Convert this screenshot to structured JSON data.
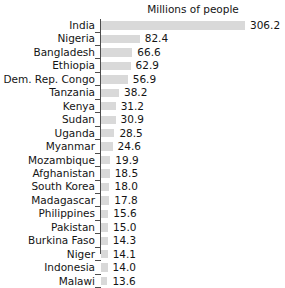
{
  "chart_data": {
    "type": "bar",
    "orientation": "horizontal",
    "title": "Millions of people",
    "xlabel": "",
    "ylabel": "",
    "xlim": [
      0,
      340
    ],
    "grid": false,
    "legend": null,
    "bar_color": "#d9d9d9",
    "axis_color": "#4d4d4d",
    "text_color": "#141414",
    "background": "#ffffff",
    "categories": [
      "India",
      "Nigeria",
      "Bangladesh",
      "Ethiopia",
      "Dem. Rep. Congo",
      "Tanzania",
      "Kenya",
      "Sudan",
      "Uganda",
      "Myanmar",
      "Mozambique",
      "Afghanistan",
      "South Korea",
      "Madagascar",
      "Philippines",
      "Pakistan",
      "Burkina Faso",
      "Niger",
      "Indonesia",
      "Malawi"
    ],
    "values": [
      306.2,
      82.4,
      66.6,
      62.9,
      56.9,
      38.2,
      31.2,
      30.9,
      28.5,
      24.6,
      19.9,
      18.5,
      18.0,
      17.8,
      15.6,
      15.0,
      14.3,
      14.1,
      14.0,
      13.6
    ],
    "value_labels": [
      "306.2",
      "82.4",
      "66.6",
      "62.9",
      "56.9",
      "38.2",
      "31.2",
      "30.9",
      "28.5",
      "24.6",
      "19.9",
      "18.5",
      "18.0",
      "17.8",
      "15.6",
      "15.0",
      "14.3",
      "14.1",
      "14.0",
      "13.6"
    ]
  }
}
